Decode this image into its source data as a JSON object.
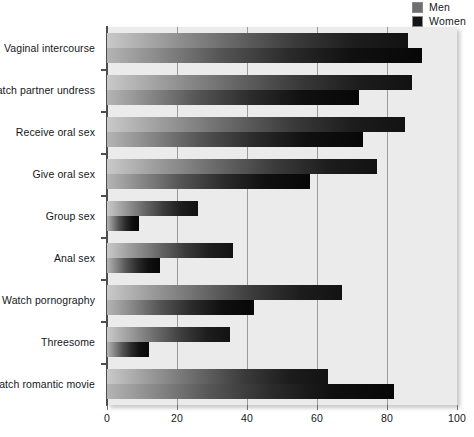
{
  "chart_data": {
    "type": "bar",
    "orientation": "horizontal",
    "title": "",
    "xlabel": "",
    "ylabel": "",
    "xlim": [
      0,
      100
    ],
    "xticks": [
      0,
      20,
      40,
      60,
      80,
      100
    ],
    "grid": true,
    "legend_position": "top-right",
    "categories": [
      "Vaginal intercourse",
      "Watch partner undress",
      "Receive oral sex",
      "Give oral sex",
      "Group sex",
      "Anal sex",
      "Watch pornography",
      "Threesome",
      "Watch romantic movie"
    ],
    "series": [
      {
        "name": "Men",
        "color": "#6a6a6a",
        "values": [
          86,
          87,
          85,
          77,
          26,
          36,
          67,
          35,
          63
        ]
      },
      {
        "name": "Women",
        "color": "#111111",
        "values": [
          90,
          72,
          73,
          58,
          9,
          15,
          42,
          12,
          82
        ]
      }
    ]
  },
  "legend": {
    "items": [
      {
        "label": "Men",
        "swatch": "#6f6f6f"
      },
      {
        "label": "Women",
        "swatch": "#141414"
      }
    ]
  },
  "axis": {
    "x_tick_labels": [
      "0",
      "20",
      "40",
      "60",
      "80",
      "100"
    ]
  }
}
